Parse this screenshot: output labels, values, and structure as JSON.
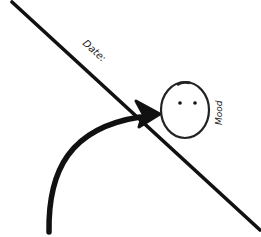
{
  "diagram": {
    "line_label": "Date:",
    "face_label": "Mood",
    "elements": [
      {
        "type": "diagonal-line",
        "from": [
          12,
          2
        ],
        "to": [
          260,
          230
        ]
      },
      {
        "type": "curved-arrow",
        "start": [
          49,
          232
        ],
        "tip": [
          158,
          114
        ]
      },
      {
        "type": "face-circle",
        "center": [
          185,
          110
        ],
        "expression": "neutral"
      }
    ],
    "colors": {
      "ink": "#111111",
      "background": "#ffffff"
    }
  }
}
